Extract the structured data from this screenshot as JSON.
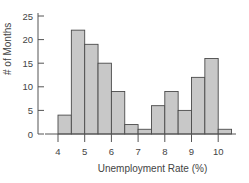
{
  "chart_data": {
    "type": "bar",
    "subtype": "histogram",
    "title": "",
    "xlabel": "Unemployment Rate (%)",
    "ylabel": "# of Months",
    "bin_width": 0.5,
    "bin_edges": [
      4.0,
      4.5,
      5.0,
      5.5,
      6.0,
      6.5,
      7.0,
      7.5,
      8.0,
      8.5,
      9.0,
      9.5,
      10.0,
      10.5
    ],
    "values": [
      4,
      22,
      19,
      15,
      9,
      2,
      1,
      6,
      9,
      5,
      12,
      16,
      1
    ],
    "x_ticks": [
      4,
      5,
      6,
      7,
      8,
      9,
      10
    ],
    "y_ticks": [
      0,
      5,
      10,
      15,
      20,
      25
    ],
    "ylim": [
      0,
      25
    ],
    "xlim": [
      4,
      10.5
    ],
    "grid": false,
    "legend": null,
    "colors": {
      "bar_fill": "#c8c8c8",
      "bar_edge": "#4a4a4a",
      "axis": "#555555"
    }
  }
}
